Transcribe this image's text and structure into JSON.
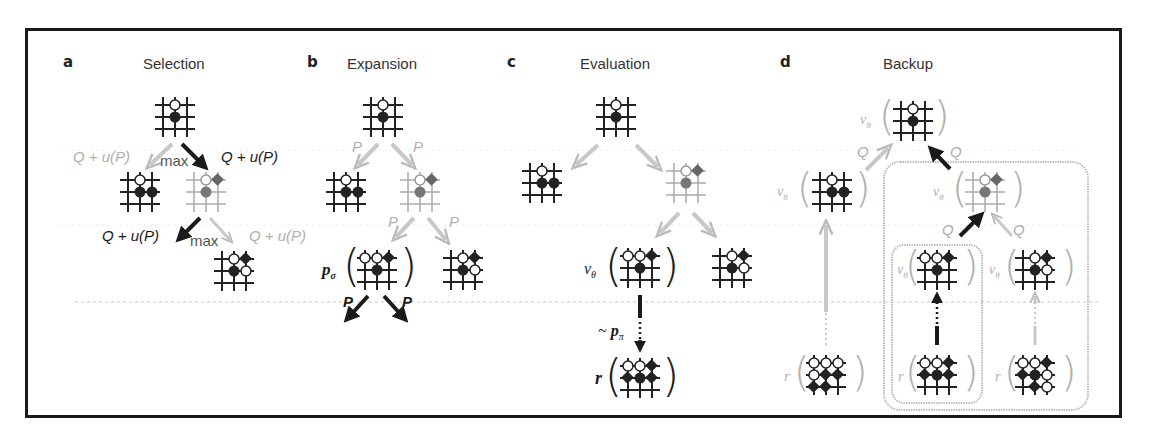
{
  "figure": {
    "panels": [
      {
        "letter": "a",
        "title": "Selection"
      },
      {
        "letter": "b",
        "title": "Expansion"
      },
      {
        "letter": "c",
        "title": "Evaluation"
      },
      {
        "letter": "d",
        "title": "Backup"
      }
    ],
    "selection": {
      "edge_left_label": "Q + u(P)",
      "edge_right_label": "Q + u(P)",
      "max_top": "max",
      "edge_left_label_2": "Q + u(P)",
      "edge_right_label_2": "Q + u(P)",
      "max_bottom": "max"
    },
    "expansion": {
      "p_left": "P",
      "p_right": "P",
      "p_left_2": "P",
      "p_right_2": "P",
      "p_sigma": "p",
      "p_sigma_sub": "σ",
      "out_left": "P",
      "out_right": "P"
    },
    "evaluation": {
      "v_theta": "v",
      "v_theta_sub": "θ",
      "rollout_tilde": "~",
      "p_pi": "p",
      "p_pi_sub": "π",
      "reward": "r"
    },
    "backup": {
      "q_labels": [
        "Q",
        "Q",
        "Q",
        "Q"
      ],
      "v_theta": "v",
      "v_theta_sub": "θ",
      "reward": "r"
    },
    "colors": {
      "frame": "#1a1a1a",
      "dark_edge": "#1a1a1a",
      "faint_edge": "#c8c8c8",
      "black_stone": "#222222",
      "gray_stone": "#7a7a7a",
      "dotted_guide": "#d8d8d8"
    }
  }
}
